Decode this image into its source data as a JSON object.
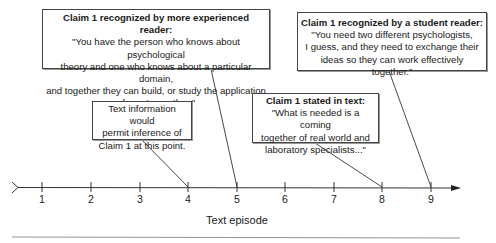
{
  "annotations": [
    {
      "id": "experienced-reader",
      "title": "Claim 1 recognized by more experienced reader:",
      "body": "\"You have the person who knows about psychological\ntheory and one who knows about a particular domain,\nand together they can build, or study the application\nof one to another.\"",
      "points_to_episode": 5
    },
    {
      "id": "student-reader",
      "title": "Claim 1 recognized by a student reader:",
      "body": "\"You need two different psychologists,\nI guess, and they need to exchange their\nideas so they can work effectively together.\"",
      "points_to_episode": 9
    },
    {
      "id": "inference",
      "title": "",
      "body": "Text information would\npermit inference of\nClaim 1 at this point.",
      "points_to_episode": 4
    },
    {
      "id": "stated-in-text",
      "title": "Claim 1 stated in text:",
      "body": "\"What is needed is a coming\ntogether of real world and\nlaboratory specialists...\"",
      "points_to_episode": 8
    }
  ],
  "axis": {
    "label": "Text episode",
    "ticks": [
      "1",
      "2",
      "3",
      "4",
      "5",
      "6",
      "7",
      "8",
      "9"
    ]
  }
}
